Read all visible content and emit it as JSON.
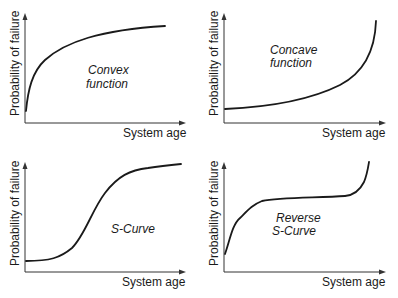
{
  "panels": [
    {
      "id": "convex",
      "ylabel": "Probability of failure",
      "xlabel": "System age",
      "curve_label_lines": [
        "Convex",
        "function"
      ]
    },
    {
      "id": "concave",
      "ylabel": "Probability of failure",
      "xlabel": "System age",
      "curve_label_lines": [
        "Concave",
        "function"
      ]
    },
    {
      "id": "s-curve",
      "ylabel": "Probability of failure",
      "xlabel": "System age",
      "curve_label_lines": [
        "S-Curve"
      ]
    },
    {
      "id": "reverse-s-curve",
      "ylabel": "Probability of failure",
      "xlabel": "System age",
      "curve_label_lines": [
        "Reverse",
        "S-Curve"
      ]
    }
  ],
  "colors": {
    "line": "#1a1a1a",
    "axis": "#333333",
    "background": "#ffffff"
  }
}
